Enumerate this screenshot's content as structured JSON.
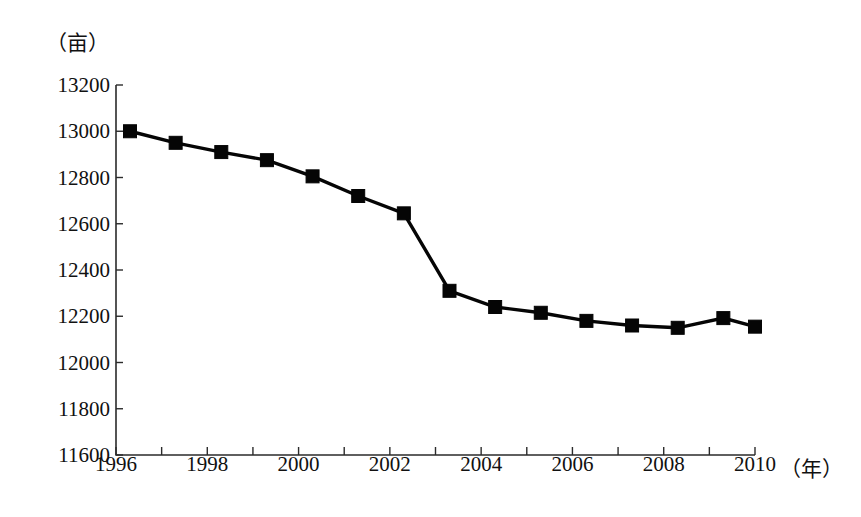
{
  "chart_data": {
    "type": "line",
    "title": "",
    "subtitle": "",
    "xlabel": "（年）",
    "ylabel": "（亩）",
    "unit_y": "（亩）",
    "unit_x": "（年）",
    "categories": [
      1996,
      1997,
      1998,
      1999,
      2000,
      2001,
      2002,
      2003,
      2004,
      2005,
      2006,
      2007,
      2008,
      2009,
      2010
    ],
    "x": [
      1996,
      1997,
      1998,
      1999,
      2000,
      2001,
      2002,
      2003,
      2004,
      2005,
      2006,
      2007,
      2008,
      2009,
      2010
    ],
    "values": [
      13000,
      12950,
      12910,
      12875,
      12805,
      12720,
      12645,
      12310,
      12240,
      12215,
      12180,
      12160,
      12150,
      12192,
      12155
    ],
    "series": [
      {
        "name": "耕地面积",
        "values": [
          13000,
          12950,
          12910,
          12875,
          12805,
          12720,
          12645,
          12310,
          12240,
          12215,
          12180,
          12160,
          12150,
          12192,
          12155
        ]
      }
    ],
    "ylim": [
      11600,
      13200
    ],
    "xlim": [
      1996,
      2010
    ],
    "ytick_labels": [
      "13200",
      "13000",
      "12800",
      "12600",
      "12400",
      "12200",
      "12000",
      "11800",
      "11600"
    ],
    "ytick_values": [
      13200,
      13000,
      12800,
      12600,
      12400,
      12200,
      12000,
      11800,
      11600
    ],
    "ytick_step": 200,
    "xtick_values": [
      1996,
      1997,
      1998,
      1999,
      2000,
      2001,
      2002,
      2003,
      2004,
      2005,
      2006,
      2007,
      2008,
      2009,
      2010
    ],
    "xtick_labels_shown": [
      "1996",
      "1998",
      "2000",
      "2002",
      "2004",
      "2006",
      "2008",
      "2010"
    ],
    "xtick_label_values": [
      1996,
      1998,
      2000,
      2002,
      2004,
      2006,
      2008,
      2010
    ],
    "xtick_label_interval": 2,
    "grid": false,
    "legend": "none",
    "marker": "square",
    "line_color": "#050505",
    "marker_color": "#050505",
    "axis_color": "#2b2b2b",
    "background_color": "#ffffff"
  },
  "layout": {
    "plot_left": 116,
    "plot_right": 755,
    "plot_top": 85,
    "plot_bottom": 455,
    "marker_size": 13,
    "first_point_offset": 14
  }
}
